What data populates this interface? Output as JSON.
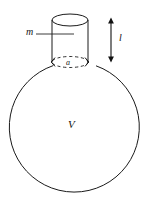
{
  "figure": {
    "background_color": "#ffffff",
    "line_color": "#1a1a1a",
    "labels": {
      "neck_mass": "m",
      "neck_radius": "a",
      "neck_length": "l",
      "vessel_volume": "V"
    },
    "geometry": {
      "sphere": {
        "cx": 74.5,
        "cy": 128,
        "r": 65
      },
      "neck": {
        "left_wall_x": 52,
        "right_wall_x": 88,
        "top_y": 20,
        "bottom_y": 62,
        "ellipse_rx": 18,
        "ellipse_ry_top": 6,
        "ellipse_ry_bottom": 5.5
      },
      "length_arrow": {
        "x": 111,
        "y_top": 18,
        "y_bottom": 62
      },
      "leader_m": {
        "x_start": 36,
        "x_end": 74,
        "y": 34
      }
    }
  }
}
